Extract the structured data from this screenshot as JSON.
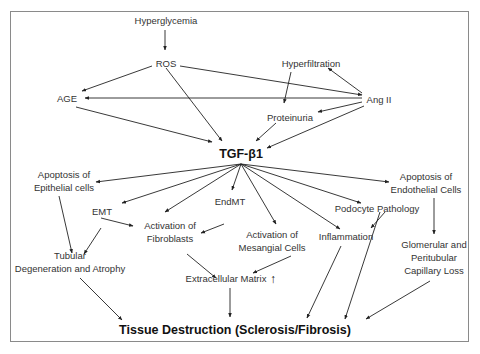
{
  "diagram": {
    "nodes": {
      "hyperglycemia": "Hyperglycemia",
      "ros": "ROS",
      "hyperfiltration": "Hyperfiltration",
      "age": "AGE",
      "ang2": "Ang II",
      "proteinuria": "Proteinuria",
      "tgf": "TGF-β1",
      "apop_epi_1": "Apoptosis of",
      "apop_epi_2": "Epithelial cells",
      "apop_endo_1": "Apoptosis of",
      "apop_endo_2": "Endothelial Cells",
      "emt": "EMT",
      "endmt": "EndMT",
      "fib_1": "Activation of",
      "fib_2": "Fibroblasts",
      "mes_1": "Activation of",
      "mes_2": "Mesangial Cells",
      "podocyte": "Podocyte Pathology",
      "inflammation": "Inflammation",
      "tub_1": "Tubular",
      "tub_2": "Degeneration and Atrophy",
      "glom_1": "Glomerular and",
      "glom_2": "Peritubular",
      "glom_3": "Capillary Loss",
      "ecm": "Extracellular Matrix",
      "ecm_up": "↑",
      "tissue": "Tissue Destruction (Sclerosis/Fibrosis)"
    },
    "edges": [
      [
        "Hyperglycemia",
        "ROS"
      ],
      [
        "ROS",
        "AGE"
      ],
      [
        "ROS",
        "TGF-β1"
      ],
      [
        "ROS",
        "Ang II"
      ],
      [
        "Ang II",
        "AGE"
      ],
      [
        "Ang II",
        "Hyperfiltration"
      ],
      [
        "Hyperfiltration",
        "Proteinuria"
      ],
      [
        "Ang II",
        "Proteinuria"
      ],
      [
        "AGE",
        "TGF-β1"
      ],
      [
        "Proteinuria",
        "TGF-β1"
      ],
      [
        "Ang II",
        "TGF-β1"
      ],
      [
        "TGF-β1",
        "Apoptosis of Epithelial cells"
      ],
      [
        "TGF-β1",
        "EMT"
      ],
      [
        "TGF-β1",
        "Activation of Fibroblasts"
      ],
      [
        "TGF-β1",
        "EndMT"
      ],
      [
        "TGF-β1",
        "Activation of Mesangial Cells"
      ],
      [
        "TGF-β1",
        "Inflammation"
      ],
      [
        "TGF-β1",
        "Podocyte Pathology"
      ],
      [
        "TGF-β1",
        "Apoptosis of Endothelial Cells"
      ],
      [
        "Apoptosis of Epithelial cells",
        "Tubular Degeneration and Atrophy"
      ],
      [
        "EMT",
        "Tubular Degeneration and Atrophy"
      ],
      [
        "EMT",
        "Activation of Fibroblasts"
      ],
      [
        "EndMT",
        "Activation of Fibroblasts"
      ],
      [
        "Podocyte Pathology",
        "Inflammation"
      ],
      [
        "Apoptosis of Endothelial Cells",
        "Glomerular and Peritubular Capillary Loss"
      ],
      [
        "Activation of Fibroblasts",
        "Extracellular Matrix"
      ],
      [
        "Activation of Mesangial Cells",
        "Extracellular Matrix"
      ],
      [
        "Tubular Degeneration and Atrophy",
        "Tissue Destruction"
      ],
      [
        "Extracellular Matrix",
        "Tissue Destruction"
      ],
      [
        "Inflammation",
        "Tissue Destruction"
      ],
      [
        "Podocyte Pathology",
        "Tissue Destruction"
      ],
      [
        "Glomerular and Peritubular Capillary Loss",
        "Tissue Destruction"
      ]
    ]
  }
}
